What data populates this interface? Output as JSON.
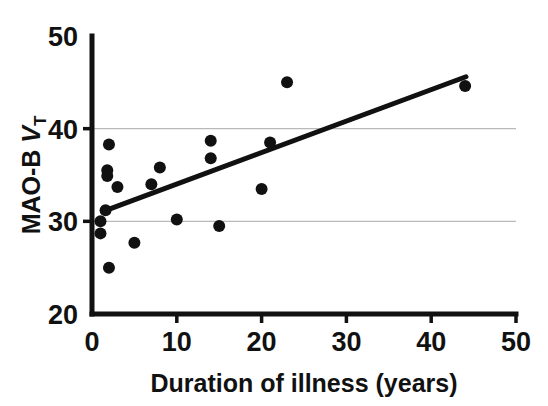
{
  "chart_data": {
    "type": "scatter",
    "title": "",
    "xlabel": "Duration of illness (years)",
    "ylabel": "MAO-B V_T",
    "ylabel_parts": {
      "main": "MAO-B ",
      "italic": "V",
      "subscript": "T"
    },
    "xlim": [
      0,
      50
    ],
    "ylim": [
      20,
      50
    ],
    "xticks": [
      0,
      10,
      20,
      30,
      40,
      50
    ],
    "yticks": [
      20,
      30,
      40,
      50
    ],
    "xtick_labels": [
      "0",
      "10",
      "20",
      "30",
      "40",
      "50"
    ],
    "ytick_labels": [
      "20",
      "30",
      "40",
      "50"
    ],
    "grid": true,
    "gridlines_y": [
      30,
      40
    ],
    "legend": null,
    "marker": {
      "shape": "circle",
      "color": "#111111",
      "size": 6
    },
    "points": [
      {
        "x": 1.0,
        "y": 30.0
      },
      {
        "x": 1.0,
        "y": 28.7
      },
      {
        "x": 1.6,
        "y": 31.2
      },
      {
        "x": 2.0,
        "y": 38.3
      },
      {
        "x": 1.8,
        "y": 35.5
      },
      {
        "x": 1.8,
        "y": 34.9
      },
      {
        "x": 2.0,
        "y": 25.0
      },
      {
        "x": 3.0,
        "y": 33.7
      },
      {
        "x": 5.0,
        "y": 27.7
      },
      {
        "x": 7.0,
        "y": 34.0
      },
      {
        "x": 8.0,
        "y": 35.8
      },
      {
        "x": 10.0,
        "y": 30.2
      },
      {
        "x": 14.0,
        "y": 38.7
      },
      {
        "x": 14.0,
        "y": 36.8
      },
      {
        "x": 15.0,
        "y": 29.5
      },
      {
        "x": 20.0,
        "y": 33.5
      },
      {
        "x": 21.0,
        "y": 38.5
      },
      {
        "x": 23.0,
        "y": 45.0
      },
      {
        "x": 44.0,
        "y": 44.6
      }
    ],
    "trend_line": {
      "type": "linear-fit",
      "x_start": 1.4,
      "y_start": 31.1,
      "x_end": 44.1,
      "y_end": 45.6
    },
    "colors": {
      "marker": "#111111",
      "axis": "#111111",
      "grid": "#b9b9b9",
      "trend": "#111111",
      "background": "#ffffff"
    }
  }
}
